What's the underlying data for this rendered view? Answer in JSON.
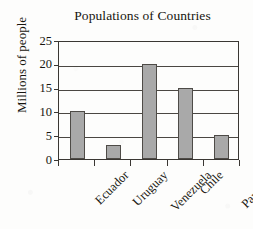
{
  "chart_data": {
    "type": "bar",
    "title": "Populations of Countries",
    "xlabel": "",
    "ylabel": "Millions of people",
    "categories": [
      "Ecuador",
      "Uruguay",
      "Venezuela",
      "Chile",
      "Paraguay"
    ],
    "values": [
      10,
      3,
      20,
      15,
      5
    ],
    "ylim": [
      0,
      25
    ],
    "yticks": [
      0,
      5,
      10,
      15,
      20,
      25
    ],
    "ytick_labels": [
      "0",
      "5",
      "10",
      "15",
      "20",
      "25"
    ],
    "grid": true,
    "legend": null,
    "bar_color": "#a9a9a9",
    "bar_edge_color": "#4e4b47",
    "axis_color": "#3a3733",
    "text_color": "#17150f",
    "background_color": "#fdfdfc"
  }
}
